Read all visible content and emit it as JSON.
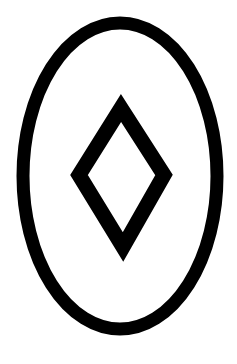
{
  "symbol": {
    "description": "Outlined ellipse containing an outlined diamond",
    "colors": {
      "background": "#ffffff",
      "stroke": "#000000"
    },
    "ellipse": {
      "cx": 120,
      "cy": 176,
      "rx": 97,
      "ry": 153,
      "stroke_width": 13
    },
    "diamond": {
      "points": "121,108 164,175 123,247 79,175",
      "stroke_width": 15
    }
  }
}
